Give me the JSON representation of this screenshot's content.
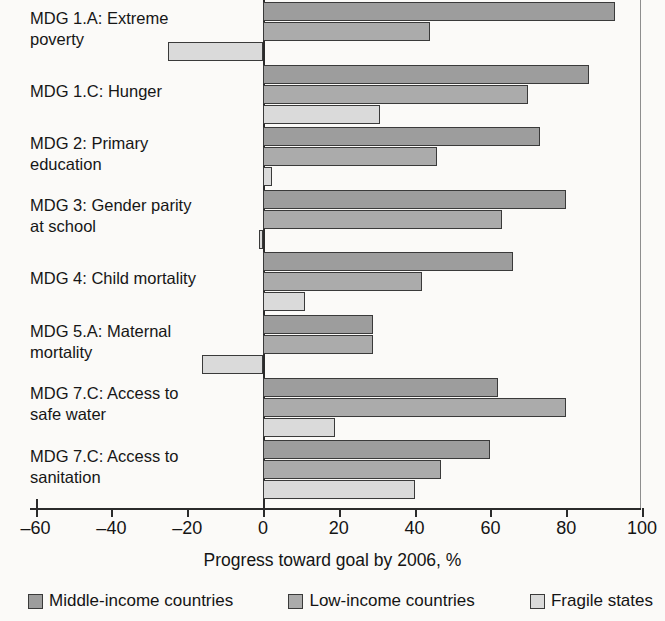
{
  "chart_data": {
    "type": "bar",
    "orientation": "horizontal",
    "title": "",
    "xlabel": "Progress toward goal by 2006, %",
    "ylabel": "",
    "xlim": [
      -60,
      100
    ],
    "xticks": [
      -60,
      -40,
      -20,
      0,
      20,
      40,
      60,
      80,
      100
    ],
    "xtick_labels": [
      "–60",
      "–40",
      "–20",
      "0",
      "20",
      "40",
      "60",
      "80",
      "100"
    ],
    "grid": false,
    "legend_position": "bottom",
    "categories": [
      "MDG 1.A: Extreme poverty",
      "MDG 1.C: Hunger",
      "MDG 2: Primary education",
      "MDG 3: Gender parity at school",
      "MDG 4: Child mortality",
      "MDG 5.A: Maternal mortality",
      "MDG 7.C: Access to safe water",
      "MDG 7.C: Access to sanitation"
    ],
    "category_lines": [
      [
        "MDG 1.A: Extreme",
        "poverty"
      ],
      [
        "MDG 1.C: Hunger"
      ],
      [
        "MDG 2: Primary",
        "education"
      ],
      [
        "MDG 3: Gender parity",
        "at school"
      ],
      [
        "MDG 4: Child mortality"
      ],
      [
        "MDG 5.A: Maternal",
        "mortality"
      ],
      [
        "MDG 7.C: Access to",
        "safe water"
      ],
      [
        "MDG 7.C: Access to",
        "sanitation"
      ]
    ],
    "series": [
      {
        "name": "Middle-income countries",
        "color": "#9d9d9d",
        "values": [
          93,
          86,
          73,
          80,
          66,
          29,
          62,
          60
        ]
      },
      {
        "name": "Low-income countries",
        "color": "#ababab",
        "values": [
          44,
          70,
          46,
          63,
          42,
          29,
          80,
          47
        ]
      },
      {
        "name": "Fragile states",
        "color": "#dadada",
        "values": [
          -25,
          31,
          2.5,
          -1,
          11,
          -16,
          19,
          40
        ]
      }
    ]
  },
  "legend": {
    "items": [
      {
        "label": "Middle-income countries",
        "swatch": "series0"
      },
      {
        "label": "Low-income countries",
        "swatch": "series1"
      },
      {
        "label": "Fragile states",
        "swatch": "series2"
      }
    ]
  }
}
